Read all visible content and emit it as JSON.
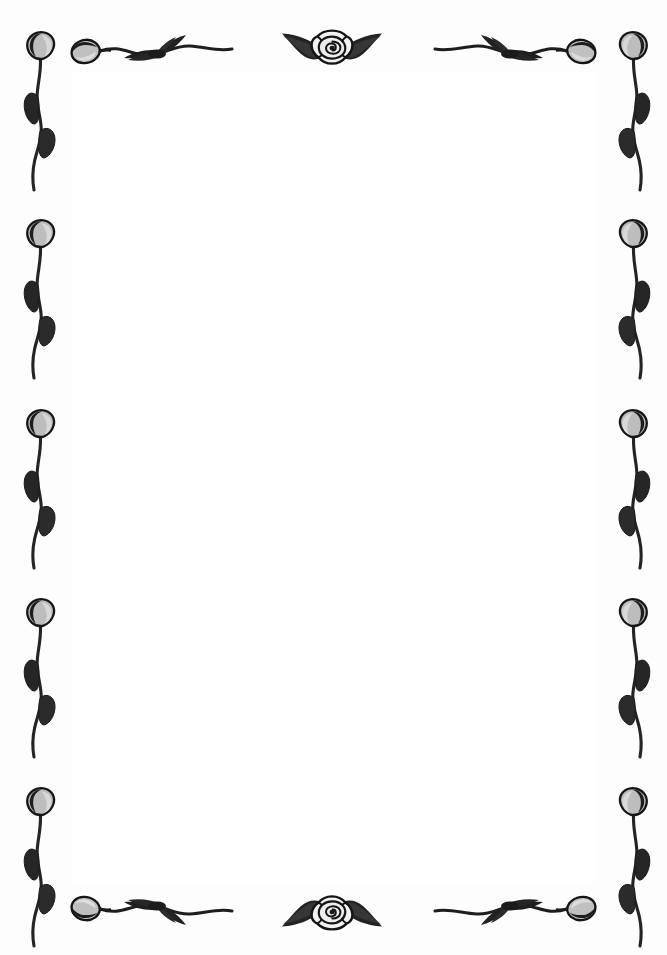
{
  "document": {
    "kind": "decorative-floral-page-border",
    "title": "Floral Border Frame",
    "page_width": 667,
    "page_height": 955,
    "body_text": "",
    "orientation": "portrait"
  },
  "colors": {
    "page_background": "#fdfdfd",
    "inner_background": "#ffffff",
    "ink_dark": "#1c1c1c",
    "ink_mid": "#4a4a4a",
    "petal_fill": "#b9b9b9",
    "petal_fill_light": "#d6d6d6",
    "leaf_fill": "#262626",
    "stem": "#242424",
    "rose_outline": "#151515",
    "paper_edge": "#f4f4f4"
  },
  "border": {
    "name": "floral-border",
    "style": "hand-drawn ink roses, buds, leaves and stems",
    "corner_buds": 4,
    "top": {
      "name": "top-border",
      "elements": [
        {
          "name": "top-left-sprig",
          "type": "bud-and-leaves-sprig",
          "x": 68,
          "y": 50,
          "width": 168,
          "mirrored": false
        },
        {
          "name": "top-center-rose",
          "type": "rose-with-wing-leaves",
          "x": 328,
          "y": 48,
          "width": 100
        },
        {
          "name": "top-right-sprig",
          "type": "bud-and-leaves-sprig",
          "x": 430,
          "y": 50,
          "width": 168,
          "mirrored": true
        }
      ]
    },
    "bottom": {
      "name": "bottom-border",
      "elements": [
        {
          "name": "bottom-left-sprig",
          "type": "bud-and-leaves-sprig",
          "x": 68,
          "y": 920,
          "width": 168,
          "mirrored": false
        },
        {
          "name": "bottom-center-rose",
          "type": "rose-with-wing-leaves",
          "x": 328,
          "y": 922,
          "width": 100
        },
        {
          "name": "bottom-right-sprig",
          "type": "bud-and-leaves-sprig",
          "x": 430,
          "y": 920,
          "width": 168,
          "mirrored": true
        }
      ]
    },
    "left": {
      "name": "left-border",
      "flower_count": 5,
      "stems": [
        {
          "name": "left-stem-1",
          "x": 38,
          "y": 30
        },
        {
          "name": "left-stem-2",
          "x": 38,
          "y": 218
        },
        {
          "name": "left-stem-3",
          "x": 38,
          "y": 408
        },
        {
          "name": "left-stem-4",
          "x": 38,
          "y": 597
        },
        {
          "name": "left-stem-5",
          "x": 38,
          "y": 786
        }
      ]
    },
    "right": {
      "name": "right-border",
      "flower_count": 5,
      "stems": [
        {
          "name": "right-stem-1",
          "x": 629,
          "y": 30
        },
        {
          "name": "right-stem-2",
          "x": 629,
          "y": 218
        },
        {
          "name": "right-stem-3",
          "x": 629,
          "y": 408
        },
        {
          "name": "right-stem-4",
          "x": 629,
          "y": 597
        },
        {
          "name": "right-stem-5",
          "x": 629,
          "y": 786
        }
      ]
    }
  }
}
